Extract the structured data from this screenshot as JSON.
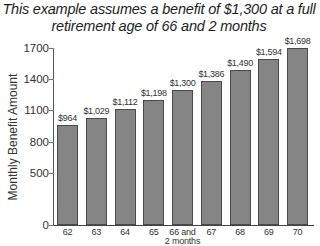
{
  "title_line1": "This example assumes a benefit of $1,300 at a full",
  "title_line2": "retirement age of 66 and 2 months",
  "chart_data": {
    "type": "bar",
    "title": "This example assumes a benefit of $1,300 at a full retirement age of 66 and 2 months",
    "xlabel": "",
    "ylabel": "Monthly Benefit Amount",
    "ylim": [
      0,
      1700
    ],
    "yticks": [
      0,
      500,
      800,
      1100,
      1400,
      1700
    ],
    "grid": false,
    "legend": null,
    "categories": [
      "62",
      "63",
      "64",
      "65",
      "66 and 2 months",
      "67",
      "68",
      "69",
      "70"
    ],
    "values": [
      964,
      1029,
      1112,
      1198,
      1300,
      1386,
      1490,
      1594,
      1698
    ],
    "data_labels": [
      "$964",
      "$1,029",
      "$1,112",
      "$1,198",
      "$1,300",
      "$1,386",
      "$1,490",
      "$1,594",
      "$1,698"
    ],
    "colors": {
      "bar_fill": "#858585",
      "bar_border": "#4a4a4a",
      "axis": "#555555"
    }
  }
}
